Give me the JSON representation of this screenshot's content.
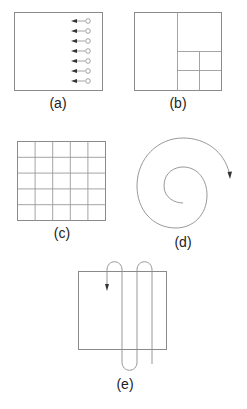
{
  "figure": {
    "panels": [
      {
        "id": "a",
        "label": "(a)",
        "description": "Square with seven parallel horizontal arrows entering from circles on the right edge, pointing left"
      },
      {
        "id": "b",
        "label": "(b)",
        "description": "Square recursively subdivided (quadtree-style): left half, top-right quarter, and bottom-right quarter split into four"
      },
      {
        "id": "c",
        "label": "(c)",
        "description": "Square divided into a uniform 5 x 5 grid"
      },
      {
        "id": "d",
        "label": "(d)",
        "description": "Spiral path winding outward clockwise, ending in an arrowhead"
      },
      {
        "id": "e",
        "label": "(e)",
        "description": "Square with a serpentine (boustrophedon) scan path looping above and below, ending in a downward arrow"
      }
    ],
    "colors": {
      "stroke": "#8a8a8a",
      "arrowhead": "#333333",
      "text": "#222222",
      "background": "#ffffff"
    }
  }
}
